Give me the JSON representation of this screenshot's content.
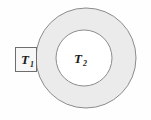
{
  "figure": {
    "name": "annulus-temperature-diagram",
    "width": 151,
    "height": 120,
    "background_color": "#fefefe"
  },
  "colors": {
    "annulus_fill": "#ebebeb",
    "inner_fill": "#ffffff",
    "stroke": "#8c8c8c",
    "box_stroke": "#6e6e6e",
    "box_fill": "#f7f7f7",
    "text": "#1a1a1a"
  },
  "shapes": {
    "outer_circle": {
      "cx": 86,
      "cy": 58,
      "r": 50
    },
    "inner_circle": {
      "cx": 84,
      "cy": 58,
      "r": 28
    },
    "box": {
      "x": 15,
      "y": 47,
      "width": 22,
      "height": 25
    }
  },
  "labels": {
    "inner_region": {
      "symbol": "T",
      "subscript": "2",
      "full": "T2"
    },
    "boundary_box": {
      "symbol": "T",
      "subscript": "1",
      "full": "T1"
    }
  }
}
